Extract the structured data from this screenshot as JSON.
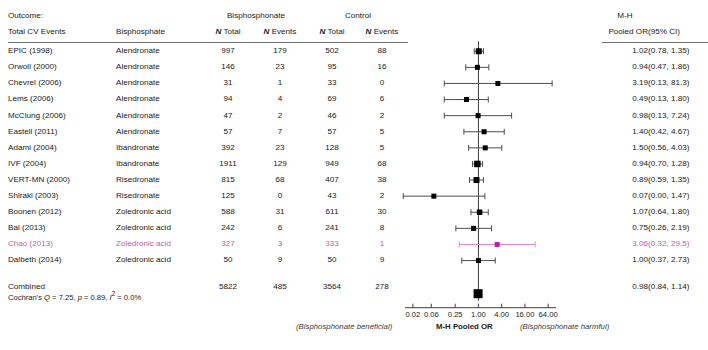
{
  "header": {
    "outcome_line1": "Outcome:",
    "outcome_line2": "Total CV Events",
    "drug_col": "Bisphosphate",
    "group_bisphosphonate": "Bisphosphonate",
    "group_control": "Control",
    "n_total": "N Total",
    "n_events": "N Events",
    "mh_line1": "M-H",
    "mh_line2": "Pooled OR",
    "ci_header": "(95% CI)"
  },
  "rows": [
    {
      "study": "EPIC (1998)",
      "drug": "Alendronate",
      "b_total": "997",
      "b_events": "179",
      "c_total": "502",
      "c_events": "88",
      "or": "1.02",
      "ci": "(0.78, 1.35)",
      "or_value": 1.02,
      "lo": 0.78,
      "hi": 1.35,
      "weight": 6,
      "arrow_left": false,
      "arrow_right": false,
      "highlight": false
    },
    {
      "study": "Orwoll (2000)",
      "drug": "Alendronate",
      "b_total": "146",
      "b_events": "23",
      "c_total": "95",
      "c_events": "16",
      "or": "0.94",
      "ci": "(0.47, 1.86)",
      "or_value": 0.94,
      "lo": 0.47,
      "hi": 1.86,
      "weight": 5,
      "arrow_left": false,
      "arrow_right": false,
      "highlight": false
    },
    {
      "study": "Chevrel (2006)",
      "drug": "Alendronate",
      "b_total": "31",
      "b_events": "1",
      "c_total": "33",
      "c_events": "0",
      "or": "3.19",
      "ci": "(0.13, 81.3)",
      "or_value": 3.19,
      "lo": 0.13,
      "hi": 81.3,
      "weight": 5,
      "arrow_left": false,
      "arrow_right": true,
      "highlight": false
    },
    {
      "study": "Lems (2006)",
      "drug": "Alendronate",
      "b_total": "94",
      "b_events": "4",
      "c_total": "69",
      "c_events": "6",
      "or": "0.49",
      "ci": "(0.13, 1.80)",
      "or_value": 0.49,
      "lo": 0.13,
      "hi": 1.8,
      "weight": 5,
      "arrow_left": false,
      "arrow_right": false,
      "highlight": false
    },
    {
      "study": "McClung (2006)",
      "drug": "Alendronate",
      "b_total": "47",
      "b_events": "2",
      "c_total": "46",
      "c_events": "2",
      "or": "0.98",
      "ci": "(0.13, 7.24)",
      "or_value": 0.98,
      "lo": 0.13,
      "hi": 7.24,
      "weight": 5,
      "arrow_left": false,
      "arrow_right": false,
      "highlight": false
    },
    {
      "study": "Eastell (2011)",
      "drug": "Alendronate",
      "b_total": "57",
      "b_events": "7",
      "c_total": "57",
      "c_events": "5",
      "or": "1.40",
      "ci": "(0.42, 4.67)",
      "or_value": 1.4,
      "lo": 0.42,
      "hi": 4.67,
      "weight": 5,
      "arrow_left": false,
      "arrow_right": false,
      "highlight": false
    },
    {
      "study": "Adami (2004)",
      "drug": "Ibandronate",
      "b_total": "392",
      "b_events": "23",
      "c_total": "128",
      "c_events": "5",
      "or": "1.50",
      "ci": "(0.56, 4.03)",
      "or_value": 1.5,
      "lo": 0.56,
      "hi": 4.03,
      "weight": 5,
      "arrow_left": false,
      "arrow_right": false,
      "highlight": false
    },
    {
      "study": "IVF (2004)",
      "drug": "Ibandronate",
      "b_total": "1911",
      "b_events": "129",
      "c_total": "949",
      "c_events": "68",
      "or": "0.94",
      "ci": "(0.70, 1.28)",
      "or_value": 0.94,
      "lo": 0.7,
      "hi": 1.28,
      "weight": 6.5,
      "arrow_left": false,
      "arrow_right": false,
      "highlight": false
    },
    {
      "study": "VERT-MN (2000)",
      "drug": "Risedronate",
      "b_total": "815",
      "b_events": "68",
      "c_total": "407",
      "c_events": "38",
      "or": "0.89",
      "ci": "(0.59, 1.35)",
      "or_value": 0.89,
      "lo": 0.59,
      "hi": 1.35,
      "weight": 6,
      "arrow_left": false,
      "arrow_right": false,
      "highlight": false
    },
    {
      "study": "Shiraki (2003)",
      "drug": "Risedronate",
      "b_total": "125",
      "b_events": "0",
      "c_total": "43",
      "c_events": "2",
      "or": "0.07",
      "ci": "(0.00, 1.47)",
      "or_value": 0.07,
      "lo": 0.002,
      "hi": 1.47,
      "weight": 5,
      "arrow_left": true,
      "arrow_right": false,
      "highlight": false
    },
    {
      "study": "Boonen (2012)",
      "drug": "Zoledronic acid",
      "b_total": "588",
      "b_events": "31",
      "c_total": "611",
      "c_events": "30",
      "or": "1.07",
      "ci": "(0.64, 1.80)",
      "or_value": 1.07,
      "lo": 0.64,
      "hi": 1.8,
      "weight": 5.5,
      "arrow_left": false,
      "arrow_right": false,
      "highlight": false
    },
    {
      "study": "Bai (2013)",
      "drug": "Zoledronic acid",
      "b_total": "242",
      "b_events": "6",
      "c_total": "241",
      "c_events": "8",
      "or": "0.75",
      "ci": "(0.26, 2.19)",
      "or_value": 0.75,
      "lo": 0.26,
      "hi": 2.19,
      "weight": 5,
      "arrow_left": false,
      "arrow_right": false,
      "highlight": false
    },
    {
      "study": "Chao (2013)",
      "drug": "Zoledronic acid",
      "b_total": "327",
      "b_events": "3",
      "c_total": "333",
      "c_events": "1",
      "or": "3.06",
      "ci": "(0.32, 29.5)",
      "or_value": 3.06,
      "lo": 0.32,
      "hi": 29.5,
      "weight": 5,
      "arrow_left": false,
      "arrow_right": false,
      "highlight": true
    },
    {
      "study": "Dalbeth (2014)",
      "drug": "Zoledronic acid",
      "b_total": "50",
      "b_events": "9",
      "c_total": "50",
      "c_events": "9",
      "or": "1.00",
      "ci": "(0.37, 2.73)",
      "or_value": 1.0,
      "lo": 0.37,
      "hi": 2.73,
      "weight": 5,
      "arrow_left": false,
      "arrow_right": false,
      "highlight": false
    }
  ],
  "combined": {
    "label": "Combined",
    "b_total": "5822",
    "b_events": "485",
    "c_total": "3564",
    "c_events": "278",
    "or": "0.98",
    "ci": "(0.84, 1.14)",
    "or_value": 0.98,
    "lo": 0.84,
    "hi": 1.14
  },
  "heterogeneity": {
    "prefix": "Cochran's ",
    "q_sym": "Q",
    "q_val": " = 7.25, ",
    "p_sym": "p",
    "p_val": " = 0.89, ",
    "i_sym": "I",
    "i_sup": "2",
    "i_val": " = 0.0%"
  },
  "axis": {
    "ticks": [
      "0.02",
      "0.06",
      "0.25",
      "1.00",
      "4.00",
      "16.00",
      "64.00"
    ],
    "tick_values": [
      0.02,
      0.06,
      0.25,
      1.0,
      4.0,
      16.0,
      64.0
    ],
    "min": 0.0125,
    "max": 102.4,
    "x_left": 405,
    "x_right": 556,
    "null_value": 1.0
  },
  "footer": {
    "left": "(Bisphosphonate beneficial)",
    "center": "M-H Pooled OR",
    "right": "(Bisphosphonate harmful)"
  },
  "colors": {
    "marker": "#000000",
    "line": "#4d4d4d",
    "highlight": "#e87fd0",
    "rule": "#6e6e6e",
    "text": "#1a1a1a"
  },
  "chart_data": {
    "type": "forest",
    "title": "Total CV Events",
    "xlabel": "M-H Pooled OR",
    "xscale": "log",
    "xlim": [
      0.0125,
      102.4
    ],
    "xticks": [
      0.02,
      0.06,
      0.25,
      1.0,
      4.0,
      16.0,
      64.0
    ],
    "reference_line": 1.0,
    "studies": [
      {
        "label": "EPIC (1998)",
        "or": 1.02,
        "ci_low": 0.78,
        "ci_high": 1.35
      },
      {
        "label": "Orwoll (2000)",
        "or": 0.94,
        "ci_low": 0.47,
        "ci_high": 1.86
      },
      {
        "label": "Chevrel (2006)",
        "or": 3.19,
        "ci_low": 0.13,
        "ci_high": 81.3
      },
      {
        "label": "Lems (2006)",
        "or": 0.49,
        "ci_low": 0.13,
        "ci_high": 1.8
      },
      {
        "label": "McClung (2006)",
        "or": 0.98,
        "ci_low": 0.13,
        "ci_high": 7.24
      },
      {
        "label": "Eastell (2011)",
        "or": 1.4,
        "ci_low": 0.42,
        "ci_high": 4.67
      },
      {
        "label": "Adami (2004)",
        "or": 1.5,
        "ci_low": 0.56,
        "ci_high": 4.03
      },
      {
        "label": "IVF (2004)",
        "or": 0.94,
        "ci_low": 0.7,
        "ci_high": 1.28
      },
      {
        "label": "VERT-MN (2000)",
        "or": 0.89,
        "ci_low": 0.59,
        "ci_high": 1.35
      },
      {
        "label": "Shiraki (2003)",
        "or": 0.07,
        "ci_low": 0.0,
        "ci_high": 1.47
      },
      {
        "label": "Boonen (2012)",
        "or": 1.07,
        "ci_low": 0.64,
        "ci_high": 1.8
      },
      {
        "label": "Bai (2013)",
        "or": 0.75,
        "ci_low": 0.26,
        "ci_high": 2.19
      },
      {
        "label": "Chao (2013)",
        "or": 3.06,
        "ci_low": 0.32,
        "ci_high": 29.5
      },
      {
        "label": "Dalbeth (2014)",
        "or": 1.0,
        "ci_low": 0.37,
        "ci_high": 2.73
      },
      {
        "label": "Combined",
        "or": 0.98,
        "ci_low": 0.84,
        "ci_high": 1.14
      }
    ]
  }
}
